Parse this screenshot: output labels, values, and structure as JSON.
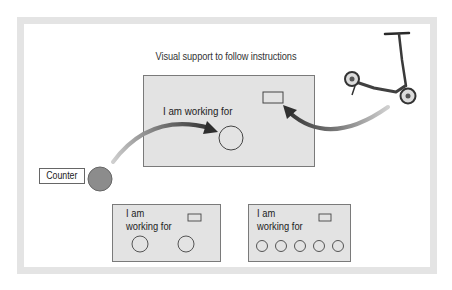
{
  "title": "Visual support to follow instructions",
  "main_board": {
    "label": "I am working for",
    "token_slots": 1
  },
  "counter": {
    "label": "Counter",
    "token_color": "#8c8c8c"
  },
  "reward_icon": "scooter-icon",
  "boards": [
    {
      "label_line1": "I am",
      "label_line2": "working for",
      "token_slots": 2
    },
    {
      "label_line1": "I am",
      "label_line2": "working for",
      "token_slots": 5
    }
  ],
  "colors": {
    "frame": "#e4e4e4",
    "board_fill": "#e3e3e3",
    "board_border": "#7a7a7a",
    "arrow_dark": "#3a3a3a",
    "arrow_light": "#c8c8c8"
  }
}
